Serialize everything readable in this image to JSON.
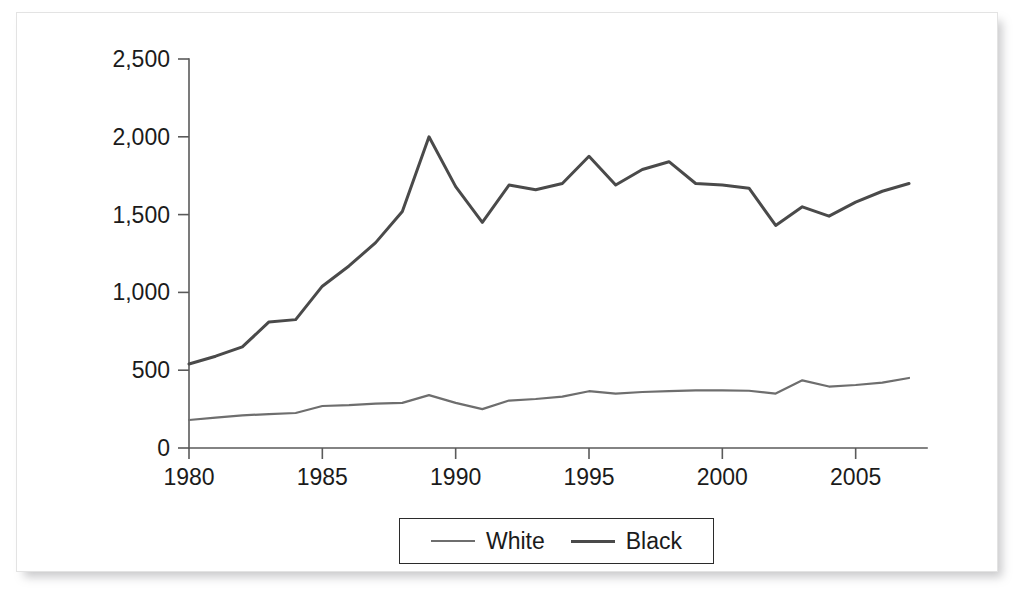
{
  "chart_data": {
    "type": "line",
    "title": "",
    "xlabel": "",
    "ylabel": "",
    "xlim": [
      1980,
      2007
    ],
    "ylim": [
      0,
      2500
    ],
    "grid": false,
    "legend_position": "bottom-center",
    "x": [
      1980,
      1981,
      1982,
      1983,
      1984,
      1985,
      1986,
      1987,
      1988,
      1989,
      1990,
      1991,
      1992,
      1993,
      1994,
      1995,
      1996,
      1997,
      1998,
      1999,
      2000,
      2001,
      2002,
      2003,
      2004,
      2005,
      2006,
      2007
    ],
    "xtick_labels": [
      "1980",
      "1985",
      "1990",
      "1995",
      "2000",
      "2005"
    ],
    "xtick_values": [
      1980,
      1985,
      1990,
      1995,
      2000,
      2005
    ],
    "ytick_labels": [
      "0",
      "500",
      "1,000",
      "1,500",
      "2,000",
      "2,500"
    ],
    "ytick_values": [
      0,
      500,
      1000,
      1500,
      2000,
      2500
    ],
    "series": [
      {
        "name": "White",
        "color": "#6e6e6e",
        "values": [
          180,
          195,
          210,
          218,
          225,
          270,
          275,
          285,
          290,
          340,
          290,
          250,
          305,
          315,
          330,
          365,
          350,
          360,
          365,
          370,
          370,
          368,
          350,
          435,
          395,
          405,
          420,
          450
        ]
      },
      {
        "name": "Black",
        "color": "#4a4a4a",
        "values": [
          540,
          590,
          650,
          810,
          825,
          1040,
          1170,
          1320,
          1520,
          2000,
          1680,
          1450,
          1690,
          1660,
          1700,
          1875,
          1690,
          1790,
          1840,
          1700,
          1690,
          1670,
          1430,
          1550,
          1490,
          1580,
          1650,
          1700
        ]
      }
    ]
  },
  "legend": {
    "entries": [
      {
        "label": "White",
        "swatch": "line-swatch-white"
      },
      {
        "label": "Black",
        "swatch": "line-swatch-black"
      }
    ]
  }
}
